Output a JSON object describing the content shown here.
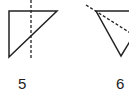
{
  "figures": [
    {
      "label": "5",
      "shape": "right-triangle",
      "axis": "vertical-dashed-line"
    },
    {
      "label": "6",
      "shape": "triangle",
      "axis": "diagonal-dashed-line"
    }
  ],
  "colors": {
    "stroke": "#222222",
    "background": "#ffffff"
  }
}
